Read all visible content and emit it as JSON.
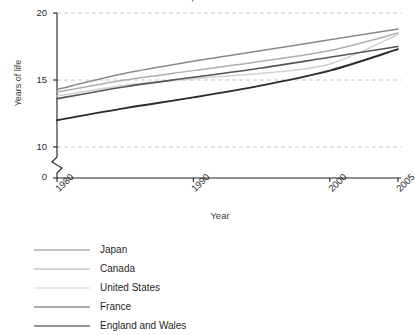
{
  "chart_data": {
    "type": "line",
    "title": "Countries of Areas, Selected Years 1980-2005",
    "xlabel": "Year",
    "ylabel": "Years of life",
    "x": [
      1980,
      1985,
      1990,
      1995,
      2000,
      2005
    ],
    "xlim": [
      1980,
      2005
    ],
    "ylim": [
      10,
      20
    ],
    "y_axis_break": true,
    "y_break_labels": [
      "0",
      "10"
    ],
    "yticks": [
      10,
      15,
      20
    ],
    "ytick_labels": [
      "10",
      "15",
      "20"
    ],
    "xticks": [
      1980,
      1990,
      2000,
      2005
    ],
    "xtick_labels": [
      "1980",
      "1990",
      "2000",
      "2005"
    ],
    "grid": "horizontal-dashed",
    "legend_position": "below",
    "series": [
      {
        "name": "Japan",
        "color": "#8a8a8a",
        "width": 1.5,
        "values": [
          14.3,
          15.5,
          16.4,
          17.2,
          18.0,
          18.8
        ]
      },
      {
        "name": "Canada",
        "color": "#aeaeae",
        "width": 1.5,
        "values": [
          14.1,
          15.0,
          15.7,
          16.4,
          17.2,
          18.5
        ]
      },
      {
        "name": "United States",
        "color": "#d2d2d2",
        "width": 1.6,
        "values": [
          13.8,
          14.6,
          15.1,
          15.5,
          16.2,
          18.4
        ]
      },
      {
        "name": "France",
        "color": "#555555",
        "width": 1.6,
        "values": [
          13.6,
          14.5,
          15.2,
          15.9,
          16.7,
          17.5
        ]
      },
      {
        "name": "England and Wales",
        "color": "#2b2b2b",
        "width": 1.9,
        "values": [
          12.0,
          12.9,
          13.7,
          14.6,
          15.7,
          17.3
        ]
      }
    ]
  },
  "axis": {
    "y_zero_label": "0"
  }
}
